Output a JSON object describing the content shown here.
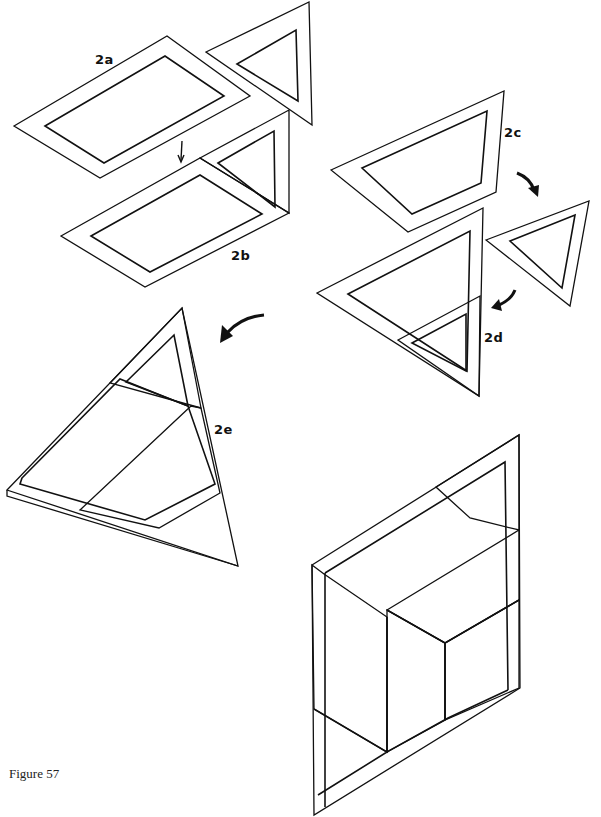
{
  "caption": "Figure 57",
  "labels": {
    "a": "2a",
    "b": "2b",
    "c": "2c",
    "d": "2d",
    "e": "2e"
  },
  "textures": {
    "stipple": {
      "name": "fine-stipple",
      "base": "#d6d6d6",
      "dot": "#333333"
    },
    "bubble": {
      "name": "coarse-bubble",
      "base": "#e8e8e8",
      "dot": "#1a1a1a"
    },
    "foam": {
      "name": "dense-foam-cells",
      "base": "#2a2a2a",
      "cell": "#f4f4f4"
    }
  },
  "steps": [
    {
      "id": "2a",
      "description": "parallelogram (bubble) with triangle (stipple) attached"
    },
    {
      "id": "2b",
      "description": "triangle folded up onto parallelogram"
    },
    {
      "id": "2c",
      "description": "trapezoid piece (foam)"
    },
    {
      "id": "2d",
      "description": "small triangle (bubble) attached to large foam triangle"
    },
    {
      "id": "2e",
      "description": "pieces combined into large triangle"
    },
    {
      "id": "final",
      "description": "assembled rhombus / isometric cube view"
    }
  ],
  "arrows": [
    {
      "id": "arrow-2a-2b",
      "direction": "down"
    },
    {
      "id": "arrow-2c-2d",
      "direction": "curved-down"
    },
    {
      "id": "arrow-small-to-2d",
      "direction": "curved-down-left"
    },
    {
      "id": "arrow-2d-2e",
      "direction": "curved-left"
    }
  ]
}
